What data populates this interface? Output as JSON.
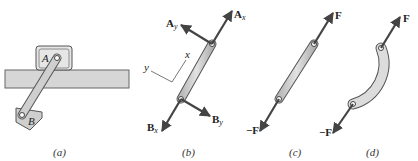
{
  "figure": {
    "panels": [
      {
        "id": "a",
        "caption": "(a)",
        "labels": {
          "pin_top": "A",
          "pin_bottom": "B"
        }
      },
      {
        "id": "b",
        "caption": "(b)",
        "labels": {
          "Ay": "A",
          "Ay_sub": "y",
          "Ax": "A",
          "Ax_sub": "x",
          "Bx": "B",
          "Bx_sub": "x",
          "By": "B",
          "By_sub": "y",
          "axis_x": "x",
          "axis_y": "y"
        }
      },
      {
        "id": "c",
        "caption": "(c)",
        "labels": {
          "top_force": "F",
          "bottom_force": "−F"
        }
      },
      {
        "id": "d",
        "caption": "(d)",
        "labels": {
          "top_force": "F",
          "bottom_force": "−F"
        }
      }
    ],
    "colors": {
      "member_fill": "#cfcfcf",
      "member_stroke": "#555555",
      "arrow": "#444444",
      "rail_fill": "#d6d6d6"
    }
  }
}
